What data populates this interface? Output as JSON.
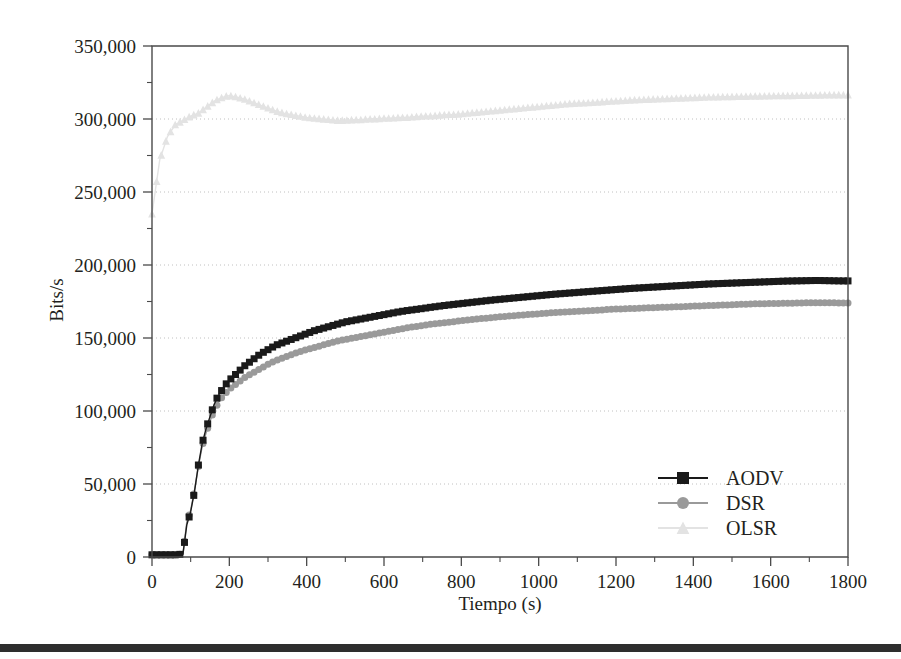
{
  "figure": {
    "background": "#ffffff",
    "artifact_bar": {
      "name": "page-edge-bar",
      "top": 644,
      "height": 8,
      "color": "#2e2e2e"
    }
  },
  "chart_data": {
    "type": "line",
    "title": "",
    "xlabel": "Tiempo (s)",
    "ylabel": "Bits/s",
    "xlim": [
      0,
      1800
    ],
    "ylim": [
      0,
      350000
    ],
    "xticks": [
      0,
      200,
      400,
      600,
      800,
      1000,
      1200,
      1400,
      1600,
      1800
    ],
    "xtick_labels": [
      "0",
      "200",
      "400",
      "600",
      "800",
      "1000",
      "1200",
      "1400",
      "1600",
      "1800"
    ],
    "x_minor_step": 100,
    "yticks": [
      0,
      50000,
      100000,
      150000,
      200000,
      250000,
      300000,
      350000
    ],
    "ytick_labels": [
      "0",
      "50,000",
      "100,000",
      "150,000",
      "200,000",
      "250,000",
      "300,000",
      "350,000"
    ],
    "y_minor_step": 25000,
    "grid": "horizontal-dotted",
    "legend_position": "lower-right-inside",
    "x": [
      0,
      20,
      40,
      60,
      80,
      90,
      100,
      110,
      120,
      130,
      140,
      150,
      160,
      170,
      180,
      190,
      200,
      220,
      240,
      260,
      280,
      300,
      320,
      340,
      360,
      380,
      400,
      420,
      440,
      460,
      480,
      500,
      520,
      540,
      560,
      580,
      600,
      620,
      640,
      660,
      680,
      700,
      720,
      740,
      760,
      780,
      800,
      820,
      840,
      860,
      880,
      900,
      920,
      940,
      960,
      980,
      1000,
      1020,
      1040,
      1060,
      1080,
      1100,
      1120,
      1140,
      1160,
      1180,
      1200,
      1220,
      1240,
      1260,
      1280,
      1300,
      1320,
      1340,
      1360,
      1380,
      1400,
      1420,
      1440,
      1460,
      1480,
      1500,
      1520,
      1540,
      1560,
      1580,
      1600,
      1620,
      1640,
      1660,
      1680,
      1700,
      1720,
      1740,
      1760,
      1780
    ],
    "series": [
      {
        "name": "AODV",
        "color": "#1a1a1a",
        "marker": "square",
        "marker_size": 7,
        "line_width": 1.4,
        "values": [
          1500,
          1500,
          1500,
          1500,
          2000,
          22000,
          31000,
          45000,
          63000,
          78000,
          88000,
          96000,
          104000,
          110000,
          114000,
          118000,
          121000,
          126000,
          131000,
          135000,
          139000,
          142000,
          145000,
          147000,
          149000,
          151000,
          153000,
          155000,
          156500,
          158000,
          159500,
          161000,
          162000,
          163000,
          164000,
          165000,
          166000,
          167000,
          168000,
          168800,
          169500,
          170200,
          171000,
          171700,
          172400,
          173000,
          173600,
          174200,
          174800,
          175400,
          176000,
          176500,
          177000,
          177500,
          178000,
          178500,
          179000,
          179500,
          180000,
          180400,
          180800,
          181200,
          181600,
          182000,
          182400,
          182800,
          183200,
          183600,
          184000,
          184300,
          184600,
          184900,
          185200,
          185500,
          185800,
          186100,
          186400,
          186700,
          187000,
          187200,
          187400,
          187600,
          187800,
          188000,
          188200,
          188400,
          188600,
          188800,
          189000,
          189100,
          189200,
          189300,
          189400,
          189300,
          189200,
          189100
        ]
      },
      {
        "name": "DSR",
        "color": "#9a9a9a",
        "marker": "circle",
        "marker_size": 7,
        "line_width": 1.4,
        "values": [
          1500,
          1500,
          1500,
          1500,
          2000,
          24000,
          32000,
          46000,
          62000,
          76000,
          85000,
          93000,
          100000,
          105000,
          109000,
          112000,
          115000,
          119000,
          123000,
          126000,
          129000,
          132000,
          134500,
          136500,
          138500,
          140500,
          142000,
          143500,
          145000,
          146500,
          148000,
          149000,
          150000,
          151000,
          152000,
          153000,
          154000,
          155000,
          156000,
          157000,
          157800,
          158600,
          159400,
          160000,
          160600,
          161200,
          161800,
          162400,
          163000,
          163500,
          164000,
          164500,
          165000,
          165400,
          165800,
          166200,
          166600,
          167000,
          167400,
          167700,
          168000,
          168300,
          168600,
          168900,
          169200,
          169500,
          169800,
          170000,
          170200,
          170400,
          170600,
          170800,
          171000,
          171200,
          171400,
          171600,
          171800,
          172000,
          172200,
          172400,
          172600,
          172800,
          173000,
          173200,
          173400,
          173500,
          173600,
          173700,
          173800,
          173900,
          174000,
          174100,
          174200,
          174200,
          174100,
          174000
        ]
      },
      {
        "name": "OLSR",
        "color": "#e3e3e3",
        "marker": "triangle",
        "marker_size": 7,
        "line_width": 1.4,
        "values": [
          235000,
          272000,
          288000,
          296000,
          299000,
          300500,
          302000,
          303000,
          304000,
          306000,
          308000,
          310000,
          312000,
          313500,
          314500,
          315500,
          316000,
          315000,
          313500,
          311500,
          309500,
          307500,
          305500,
          304000,
          303000,
          302000,
          301000,
          300500,
          300000,
          299500,
          299000,
          299000,
          299500,
          299500,
          300000,
          300000,
          300500,
          300500,
          301000,
          301000,
          301500,
          302000,
          302000,
          302500,
          303000,
          303000,
          303500,
          304000,
          304500,
          305000,
          305500,
          306000,
          306500,
          307000,
          307500,
          308000,
          308500,
          309000,
          309500,
          310000,
          310500,
          310800,
          311000,
          311300,
          311600,
          312000,
          312300,
          312600,
          313000,
          313200,
          313400,
          313600,
          313800,
          314000,
          314200,
          314400,
          314600,
          314800,
          315000,
          315100,
          315200,
          315300,
          315400,
          315500,
          315600,
          315700,
          315800,
          315900,
          316000,
          316000,
          316100,
          316200,
          316300,
          316400,
          316500,
          316500
        ]
      }
    ],
    "legend": [
      {
        "label": "AODV",
        "color": "#1a1a1a",
        "marker": "square"
      },
      {
        "label": "DSR",
        "color": "#9a9a9a",
        "marker": "circle"
      },
      {
        "label": "OLSR",
        "color": "#e3e3e3",
        "marker": "triangle"
      }
    ]
  }
}
